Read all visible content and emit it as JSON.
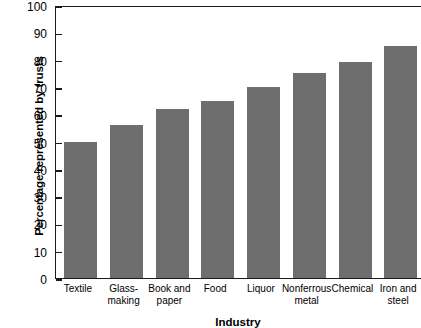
{
  "chart_data": {
    "type": "bar",
    "title": "",
    "xlabel": "Industry",
    "ylabel": "Percentage represented by trusts",
    "categories": [
      "Textile",
      "Glass-\nmaking",
      "Book and\npaper",
      "Food",
      "Liquor",
      "Nonferrous\nmetal",
      "Chemical",
      "Iron and\nsteel"
    ],
    "values": [
      50,
      56,
      62,
      65,
      70,
      75,
      79,
      85
    ],
    "ylim": [
      0,
      100
    ],
    "yticks": [
      0,
      10,
      20,
      30,
      40,
      50,
      60,
      70,
      80,
      90,
      100
    ],
    "ytick_labels": [
      "0",
      "10",
      "20",
      "30",
      "40",
      "50",
      "60",
      "70",
      "80",
      "90",
      "100"
    ],
    "grid": false,
    "legend": "none",
    "bar_color": "#6e6e6e",
    "axis_color": "#1a1a1a",
    "background": "#ffffff"
  }
}
